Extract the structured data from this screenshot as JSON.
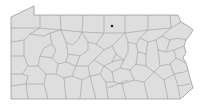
{
  "map": {
    "region": "Pennsylvania",
    "subdivisions": "counties",
    "fill_color": "#dedede",
    "border_color": "#9a9a9a",
    "background_color": "#ffffff",
    "marker": {
      "shape": "dot",
      "color": "#222222",
      "approx_location": "Potter County (north-central)",
      "x": 112,
      "y": 26
    }
  }
}
